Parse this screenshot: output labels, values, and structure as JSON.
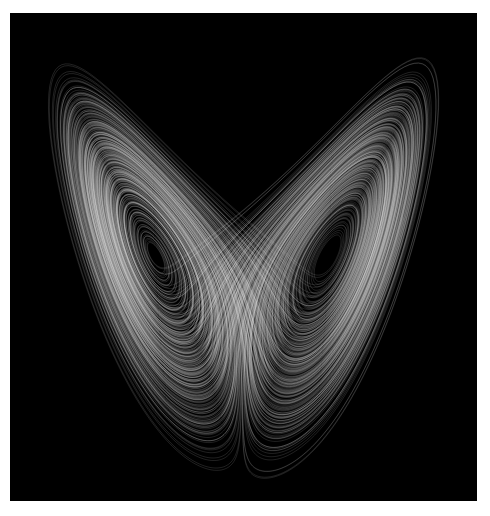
{
  "image": {
    "subject": "Lorenz attractor",
    "background_color": "#000000",
    "border_color": "#ffffff",
    "trace_color": "#ffffff",
    "parameters": {
      "sigma": 10,
      "rho": 28,
      "beta": 2.6666667
    }
  }
}
